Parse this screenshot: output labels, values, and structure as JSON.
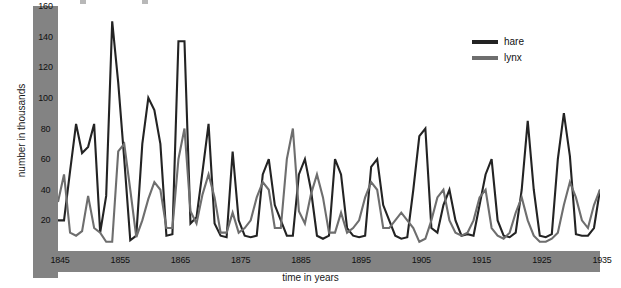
{
  "chart_data": {
    "type": "line",
    "title": "",
    "xlabel": "time in years",
    "ylabel": "number in thousands",
    "xlim": [
      1845,
      1935
    ],
    "ylim": [
      0,
      160
    ],
    "grid": false,
    "legend_position": "top-right",
    "y_ticks": [
      20,
      40,
      60,
      80,
      100,
      120,
      140,
      160
    ],
    "x_ticks": [
      1845,
      1855,
      1865,
      1875,
      1885,
      1895,
      1905,
      1915,
      1925,
      1935
    ],
    "x": [
      1845,
      1846,
      1847,
      1848,
      1849,
      1850,
      1851,
      1852,
      1853,
      1854,
      1855,
      1856,
      1857,
      1858,
      1859,
      1860,
      1861,
      1862,
      1863,
      1864,
      1865,
      1866,
      1867,
      1868,
      1869,
      1870,
      1871,
      1872,
      1873,
      1874,
      1875,
      1876,
      1877,
      1878,
      1879,
      1880,
      1881,
      1882,
      1883,
      1884,
      1885,
      1886,
      1887,
      1888,
      1889,
      1890,
      1891,
      1892,
      1893,
      1894,
      1895,
      1896,
      1897,
      1898,
      1899,
      1900,
      1901,
      1902,
      1903,
      1904,
      1905,
      1906,
      1907,
      1908,
      1909,
      1910,
      1911,
      1912,
      1913,
      1914,
      1915,
      1916,
      1917,
      1918,
      1919,
      1920,
      1921,
      1922,
      1923,
      1924,
      1925,
      1926,
      1927,
      1928,
      1929,
      1930,
      1931,
      1932,
      1933,
      1934,
      1935
    ],
    "series": [
      {
        "name": "hare",
        "color": "#232323",
        "values": [
          20,
          20,
          52,
          83,
          64,
          68,
          83,
          12,
          36,
          150,
          110,
          60,
          7,
          10,
          70,
          100,
          92,
          70,
          10,
          11,
          137,
          137,
          18,
          22,
          52,
          83,
          18,
          10,
          9,
          65,
          20,
          10,
          9,
          10,
          50,
          60,
          30,
          20,
          10,
          10,
          50,
          60,
          40,
          10,
          8,
          10,
          60,
          50,
          15,
          10,
          9,
          10,
          55,
          60,
          30,
          20,
          10,
          8,
          9,
          40,
          75,
          80,
          15,
          12,
          30,
          40,
          20,
          10,
          11,
          10,
          30,
          50,
          60,
          20,
          10,
          9,
          12,
          40,
          85,
          40,
          10,
          9,
          11,
          60,
          90,
          62,
          11,
          10,
          10,
          15,
          40
        ]
      },
      {
        "name": "lynx",
        "color": "#6e6e6e",
        "values": [
          32,
          50,
          12,
          10,
          13,
          36,
          15,
          12,
          6,
          6,
          65,
          70,
          40,
          9,
          20,
          34,
          45,
          40,
          15,
          15,
          60,
          80,
          26,
          18,
          37,
          50,
          35,
          12,
          12,
          25,
          12,
          15,
          20,
          35,
          45,
          40,
          15,
          15,
          60,
          80,
          26,
          18,
          37,
          50,
          35,
          12,
          12,
          25,
          12,
          15,
          20,
          35,
          45,
          40,
          15,
          15,
          20,
          25,
          20,
          15,
          6,
          8,
          20,
          35,
          40,
          20,
          12,
          10,
          12,
          20,
          35,
          40,
          15,
          10,
          8,
          12,
          25,
          35,
          20,
          10,
          6,
          6,
          8,
          12,
          30,
          45,
          35,
          20,
          15,
          30,
          40
        ]
      }
    ]
  },
  "axes": {
    "y_title": "number in thousands",
    "x_title": "time in years",
    "y_tick_labels": [
      "160",
      "140",
      "120",
      "100",
      "80",
      "60",
      "40",
      "20"
    ],
    "x_tick_labels": [
      "1845",
      "1855",
      "1865",
      "1875",
      "1885",
      "1895",
      "1905",
      "1915",
      "1925",
      "1935"
    ],
    "band_color": "#838383"
  },
  "legend": {
    "entries": [
      {
        "label": "hare",
        "color": "#232323"
      },
      {
        "label": "lynx",
        "color": "#6e6e6e"
      }
    ]
  }
}
